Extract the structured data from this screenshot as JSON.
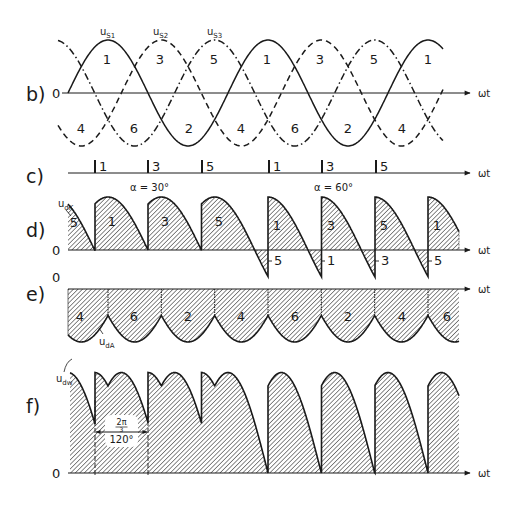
{
  "figure": {
    "ink_color": "#1a1a1a",
    "background": "#ffffff",
    "hatch_color": "#2a2a2a",
    "axis_label": "ωt",
    "zero_label": "0",
    "geometry": {
      "origin_x": 68,
      "period_px": 160,
      "end_x": 459
    }
  },
  "panels": {
    "b": {
      "label": "b)",
      "axis_y": 93,
      "amplitude_px": 53,
      "curve_end_x": 443,
      "axis_end_x": 470,
      "wt_x": 478,
      "curves": [
        {
          "name": "u_S1",
          "label": "u",
          "sub": "S1",
          "phase_deg": 0,
          "style": "solid",
          "label_x": 100,
          "label_y": 35
        },
        {
          "name": "u_S2",
          "label": "u",
          "sub": "S2",
          "phase_deg": 120,
          "style": "dashed",
          "label_x": 153,
          "label_y": 35
        },
        {
          "name": "u_S3",
          "label": "u",
          "sub": "S3",
          "phase_deg": 240,
          "style": "dash-dot",
          "label_x": 207,
          "label_y": 35
        }
      ],
      "upper_labels": [
        {
          "text": "1",
          "x": 107,
          "y": 64
        },
        {
          "text": "3",
          "x": 160,
          "y": 64
        },
        {
          "text": "5",
          "x": 214,
          "y": 64
        },
        {
          "text": "1",
          "x": 267,
          "y": 64
        },
        {
          "text": "3",
          "x": 320,
          "y": 64
        },
        {
          "text": "5",
          "x": 374,
          "y": 64
        },
        {
          "text": "1",
          "x": 428,
          "y": 64
        }
      ],
      "lower_labels": [
        {
          "text": "4",
          "x": 81,
          "y": 133
        },
        {
          "text": "6",
          "x": 134,
          "y": 133
        },
        {
          "text": "2",
          "x": 189,
          "y": 133
        },
        {
          "text": "4",
          "x": 241,
          "y": 133
        },
        {
          "text": "6",
          "x": 295,
          "y": 133
        },
        {
          "text": "2",
          "x": 348,
          "y": 133
        },
        {
          "text": "4",
          "x": 402,
          "y": 133
        }
      ]
    },
    "c": {
      "label": "c)",
      "axis_y": 173,
      "axis_start_x": 68,
      "axis_end_x": 470,
      "wt_x": 478,
      "ticks": [
        {
          "label": "1",
          "x": 95
        },
        {
          "label": "3",
          "x": 148
        },
        {
          "label": "5",
          "x": 202
        },
        {
          "label": "1",
          "x": 269
        },
        {
          "label": "3",
          "x": 322
        },
        {
          "label": "5",
          "x": 376
        }
      ],
      "annotations": [
        {
          "text": "α = 30°",
          "x": 130,
          "y": 191
        },
        {
          "text": "α = 60°",
          "x": 314,
          "y": 191
        }
      ]
    },
    "d": {
      "label": "d)",
      "zero_y": 250,
      "amplitude_px": 53,
      "curve_label": "u",
      "curve_sub": "dK",
      "alpha_first_deg": 30,
      "alpha_second_deg": 60,
      "switch_after_x": 240,
      "axis_end_x": 470,
      "wt_x": 478,
      "segment_labels": [
        {
          "text": "5",
          "x": 74,
          "y": 227
        },
        {
          "text": "1",
          "x": 112,
          "y": 226
        },
        {
          "text": "3",
          "x": 165,
          "y": 226
        },
        {
          "text": "5",
          "x": 219,
          "y": 226
        },
        {
          "text": "1",
          "x": 277,
          "y": 230
        },
        {
          "text": "3",
          "x": 331,
          "y": 230
        },
        {
          "text": "5",
          "x": 384,
          "y": 230
        },
        {
          "text": "1",
          "x": 437,
          "y": 230
        }
      ],
      "negative_labels": [
        {
          "text": "5",
          "x": 274,
          "y": 265
        },
        {
          "text": "1",
          "x": 327,
          "y": 265
        },
        {
          "text": "3",
          "x": 381,
          "y": 265
        },
        {
          "text": "5",
          "x": 434,
          "y": 265
        }
      ]
    },
    "e": {
      "label": "e)",
      "zero_y": 289,
      "amplitude_px": 53,
      "curve_label": "u",
      "curve_sub": "dA",
      "axis_end_x": 470,
      "wt_x": 478,
      "segment_labels": [
        {
          "text": "4",
          "x": 80,
          "y": 321
        },
        {
          "text": "6",
          "x": 134,
          "y": 321
        },
        {
          "text": "2",
          "x": 188,
          "y": 321
        },
        {
          "text": "4",
          "x": 241,
          "y": 321
        },
        {
          "text": "6",
          "x": 295,
          "y": 321
        },
        {
          "text": "2",
          "x": 348,
          "y": 321
        },
        {
          "text": "4",
          "x": 402,
          "y": 321
        },
        {
          "text": "6",
          "x": 447,
          "y": 321
        }
      ]
    },
    "f": {
      "label": "f)",
      "zero_y": 473,
      "curve_label": "u",
      "curve_sub": "dw",
      "axis_end_x": 470,
      "wt_x": 478,
      "dimension": {
        "x1": 95,
        "x2": 148,
        "y": 432,
        "fraction_num": "2π",
        "fraction_den": "3",
        "degrees": "120°"
      }
    }
  }
}
